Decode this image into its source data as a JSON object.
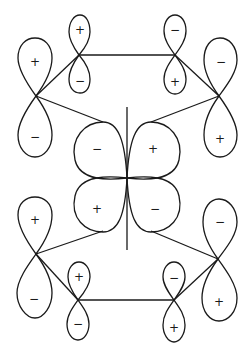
{
  "diagram": {
    "central_orbital": {
      "type": "d",
      "lobes": [
        {
          "position": "upper-left",
          "sign": "−"
        },
        {
          "position": "upper-right",
          "sign": "+"
        },
        {
          "position": "lower-left",
          "sign": "+"
        },
        {
          "position": "lower-right",
          "sign": "−"
        }
      ]
    },
    "p_orbitals": [
      {
        "id": "top-left-outer",
        "upper_sign": "+",
        "lower_sign": "−"
      },
      {
        "id": "top-left-inner",
        "upper_sign": "+",
        "lower_sign": "−"
      },
      {
        "id": "top-right-inner",
        "upper_sign": "−",
        "lower_sign": "+"
      },
      {
        "id": "top-right-outer",
        "upper_sign": "−",
        "lower_sign": "+"
      },
      {
        "id": "bottom-left-outer",
        "upper_sign": "+",
        "lower_sign": "−"
      },
      {
        "id": "bottom-left-inner",
        "upper_sign": "+",
        "lower_sign": "−"
      },
      {
        "id": "bottom-right-inner",
        "upper_sign": "−",
        "lower_sign": "+"
      },
      {
        "id": "bottom-right-outer",
        "upper_sign": "−",
        "lower_sign": "+"
      }
    ]
  }
}
